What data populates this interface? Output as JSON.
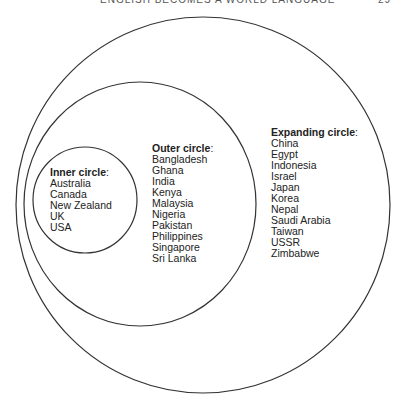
{
  "header": {
    "title": "ENGLISH BECOMES A WORLD LANGUAGE",
    "page": "29"
  },
  "diagram": {
    "inner": {
      "heading": "Inner circle",
      "items": [
        "Australia",
        "Canada",
        "New Zealand",
        "UK",
        "USA"
      ]
    },
    "outer": {
      "heading": "Outer circle",
      "items": [
        "Bangladesh",
        "Ghana",
        "India",
        "Kenya",
        "Malaysia",
        "Nigeria",
        "Pakistan",
        "Philippines",
        "Singapore",
        "Sri Lanka"
      ]
    },
    "expanding": {
      "heading": "Expanding circle",
      "items": [
        "China",
        "Egypt",
        "Indonesia",
        "Israel",
        "Japan",
        "Korea",
        "Nepal",
        "Saudi Arabia",
        "Taiwan",
        "USSR",
        "Zimbabwe"
      ]
    },
    "colon": ":"
  }
}
